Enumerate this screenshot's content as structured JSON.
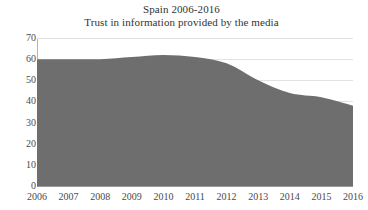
{
  "chart_data": {
    "type": "area",
    "title": "Spain 2006-2016",
    "subtitle": "Trust in information provided by the media",
    "xlabel": "",
    "ylabel": "",
    "categories": [
      2006,
      2007,
      2008,
      2009,
      2010,
      2011,
      2012,
      2013,
      2014,
      2015,
      2016
    ],
    "values": [
      60,
      60,
      60,
      61,
      62,
      61,
      58,
      50,
      44,
      42,
      38
    ],
    "series": [
      {
        "name": "Trust in information provided by the media",
        "values": [
          60,
          60,
          60,
          61,
          62,
          61,
          58,
          50,
          44,
          42,
          38
        ]
      }
    ],
    "ylim": [
      0,
      70
    ],
    "ytick_labels": [
      "70",
      "60",
      "50",
      "40",
      "30",
      "20",
      "10",
      "0"
    ],
    "yticks": [
      70,
      60,
      50,
      40,
      30,
      20,
      10,
      0
    ],
    "xtick_labels": [
      "2006",
      "2007",
      "2008",
      "2009",
      "2010",
      "2011",
      "2012",
      "2013",
      "2014",
      "2015",
      "2016"
    ],
    "grid": true,
    "legend": false,
    "legend_position": "none",
    "colors": {
      "area_fill": "#6e6e6e",
      "gridline": "#e2e2e2",
      "axis": "#9a9a9a",
      "text": "#3a3a3a",
      "background": "#ffffff"
    }
  }
}
